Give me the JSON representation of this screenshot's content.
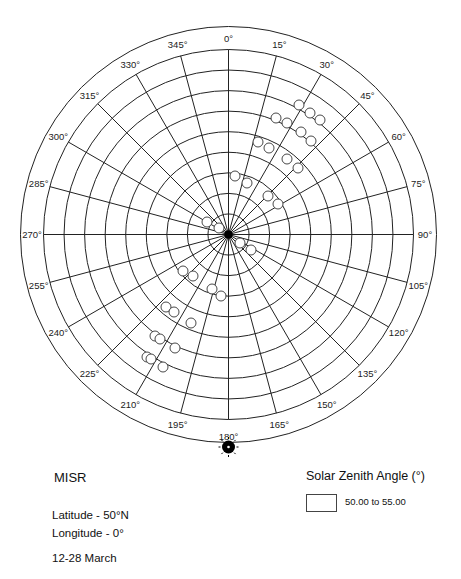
{
  "chart_data": {
    "type": "scatter",
    "projection": "polar-sky",
    "title": "MISR",
    "info": {
      "latitude": "Latitude - 50°N",
      "longitude": "Longitude - 0°",
      "dates": "12-28 March"
    },
    "legend": {
      "title": "Solar Zenith Angle (°)",
      "entries": [
        {
          "label": "50.00 to 55.00",
          "fill": "#ffffff",
          "stroke": "#444444"
        }
      ]
    },
    "azimuth_ticks": [
      "0°",
      "15°",
      "30°",
      "45°",
      "60°",
      "75°",
      "90°",
      "105°",
      "120°",
      "135°",
      "150°",
      "165°",
      "180°",
      "195°",
      "210°",
      "225°",
      "240°",
      "255°",
      "270°",
      "285°",
      "300°",
      "315°",
      "330°",
      "345°"
    ],
    "zenith_rings_deg": [
      10,
      20,
      30,
      40,
      50,
      60,
      70,
      80,
      90
    ],
    "sun_position": {
      "azimuth_deg": 180,
      "zenith_deg": 52.5
    },
    "points_px": [
      [
        299,
        105
      ],
      [
        310,
        113
      ],
      [
        320,
        120
      ],
      [
        276,
        118
      ],
      [
        287,
        123
      ],
      [
        301,
        132
      ],
      [
        311,
        141
      ],
      [
        258,
        142
      ],
      [
        269,
        148
      ],
      [
        287,
        159
      ],
      [
        298,
        168
      ],
      [
        235,
        176
      ],
      [
        247,
        183
      ],
      [
        268,
        196
      ],
      [
        278,
        204
      ],
      [
        207,
        222
      ],
      [
        219,
        228
      ],
      [
        240,
        243
      ],
      [
        251,
        250
      ],
      [
        183,
        271
      ],
      [
        193,
        276
      ],
      [
        212,
        289
      ],
      [
        221,
        296
      ],
      [
        166,
        307
      ],
      [
        174,
        312
      ],
      [
        191,
        323
      ],
      [
        155,
        336
      ],
      [
        160,
        339
      ],
      [
        175,
        348
      ],
      [
        147,
        357
      ],
      [
        151,
        359
      ],
      [
        163,
        367
      ]
    ],
    "colors": {
      "line": "#222222",
      "point_fill": "#ffffff",
      "sun": "#000000"
    }
  }
}
